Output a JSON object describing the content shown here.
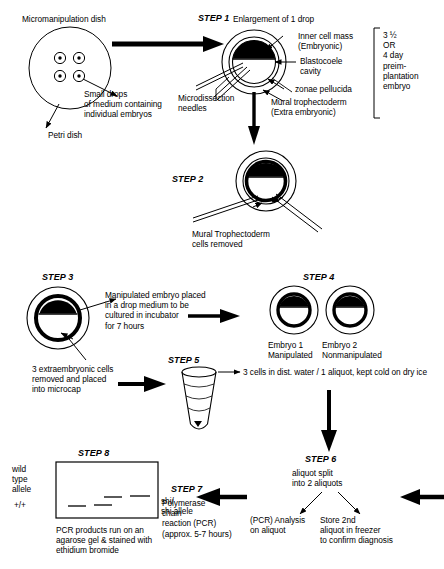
{
  "diagram": {
    "steps": {
      "s1": "STEP 1",
      "s2": "STEP 2",
      "s3": "STEP 3",
      "s4": "STEP 4",
      "s5": "STEP 5",
      "s6": "STEP 6",
      "s7": "STEP 7",
      "s8": "STEP 8"
    },
    "labels": {
      "micromanipulation_dish": "Micromanipulation dish",
      "small_drops": "Small drops\nof medium containing\nindividual embryos",
      "petri_dish": "Petri dish",
      "enlargement": "Enlargement of 1 drop",
      "microdissection_needles": "Microdissection\nneedles",
      "inner_cell_mass": "Inner cell mass\n(Embryonic)",
      "blastocoele_cavity": "Blastocoele\ncavity",
      "zonae_pellucida": "zonae pellucida",
      "mural_trophectoderm": "Mural trophectoderm\n(Extra embryonic)",
      "embryo_age": "3 ½\nOR\n4 day\npreim-\nplantation\nembryo",
      "mural_cells_removed": "Mural Trophectoderm\ncells removed",
      "manipulated_embryo": "Manipulated embryo placed\nin a drop medium to be\ncultured in incubator\nfor 7 hours",
      "extraembryonic_removed": "3 extraembryonic cells\nremoved and placed\ninto microcap",
      "embryo1": "Embryo 1\nManipulated",
      "embryo2": "Embryo 2\nNonmanipulated",
      "three_cells": "3 cells in dist. water / 1 aliquot, kept cold on dry ice",
      "aliquot_split": "aliquot split\ninto 2 aliquots",
      "pcr_analysis": "(PCR) Analysis\non aliquot",
      "store_second": "Store 2nd\naliquot in freezer\nto confirm diagnosis",
      "pcr_step7": "Polymerase\nchain\nreaction (PCR)\n(approx. 5-7 hours)",
      "wild_type_allele": "wild\ntype\nallele",
      "plus_plus": "+/+",
      "shi_allele": "shi/\nshi allele",
      "gel_caption": "PCR products run on an\nagarose gel & stained with\nethidium bromide"
    },
    "colors": {
      "ink": "#000000",
      "paper": "#ffffff"
    }
  }
}
